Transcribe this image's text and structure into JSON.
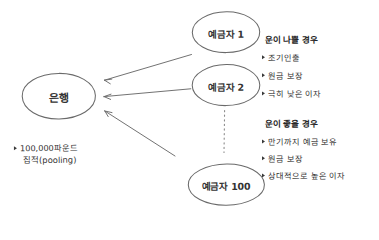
{
  "diagram": {
    "title": "",
    "style": "hand-drawn",
    "background_color": "#ffffff",
    "stroke_color": "#555555",
    "text_color": "#333333"
  },
  "nodes": {
    "bank": {
      "label": "은행"
    },
    "depositors": [
      {
        "label": "예금자 1"
      },
      {
        "label": "예금자 2"
      },
      {
        "label": "예금자 100"
      }
    ]
  },
  "left_note": {
    "bullet": "▶",
    "line1": "100,000파운드",
    "line2": "집적(pooling)"
  },
  "right_blocks": [
    {
      "heading": "운이 나쁠 경우",
      "items": [
        "조기인출",
        "원금 보장",
        "극히 낮은 이자"
      ]
    },
    {
      "heading": "운이 좋을 경우",
      "items": [
        "만기까지 예금 보유",
        "원금 보장",
        "상대적으로 높은 이자"
      ]
    }
  ],
  "connectors": {
    "arrows": [
      {
        "name": "depositor-1-to-bank",
        "direction": "left"
      },
      {
        "name": "depositor-2-to-bank",
        "direction": "left"
      },
      {
        "name": "depositor-100-to-bank",
        "direction": "left"
      }
    ],
    "dotted_line": {
      "name": "ellipsis-connector",
      "orientation": "vertical"
    }
  }
}
